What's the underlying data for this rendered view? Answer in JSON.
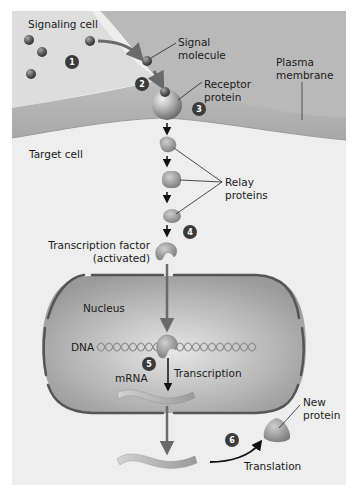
{
  "figure": {
    "regions": {
      "signaling_cell": "Signaling cell",
      "target_cell": "Target cell",
      "nucleus": "Nucleus",
      "plasma_membrane": [
        "Plasma",
        "membrane"
      ]
    },
    "labels": {
      "signal_molecule": [
        "Signal",
        "molecule"
      ],
      "receptor_protein": [
        "Receptor",
        "protein"
      ],
      "relay_proteins": [
        "Relay",
        "proteins"
      ],
      "transcription_factor": [
        "Transcription factor",
        "(activated)"
      ],
      "dna": "DNA",
      "mrna": "mRNA",
      "transcription": "Transcription",
      "translation": "Translation",
      "new_protein": [
        "New",
        "protein"
      ]
    },
    "steps": [
      "1",
      "2",
      "3",
      "4",
      "5",
      "6"
    ],
    "colors": {
      "background": "#ffffff",
      "panel": "#e9e9e9",
      "signaling_cell": "#dcdcdc",
      "membrane": "#b4b4b4",
      "target_cell": "#eeeeee",
      "nucleus_fill": "#a9a9a9",
      "nucleus_envelope": "#555555",
      "molecule": "#5f5f5f",
      "protein": "#8c8c8c",
      "arrow": "#111111",
      "step_badge": "#3b3b3b"
    }
  }
}
